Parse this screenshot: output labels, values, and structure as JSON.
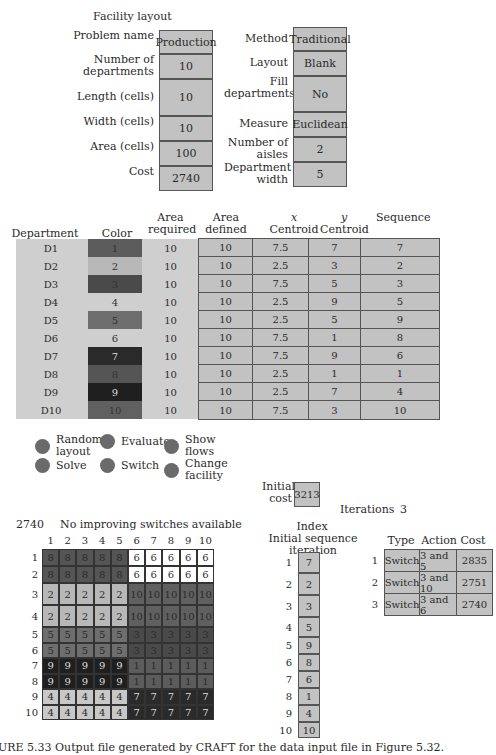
{
  "title": "Facility layout",
  "params_left": [
    {
      "label": "Problem name",
      "value": "Production"
    },
    {
      "label": "Number of departments",
      "value": "10"
    },
    {
      "label": "Length (cells)",
      "value": "10"
    },
    {
      "label": "Width (cells)",
      "value": "10"
    },
    {
      "label": "Area (cells)",
      "value": "100"
    },
    {
      "label": "Cost",
      "value": "2740"
    }
  ],
  "params_right": [
    {
      "label": "Method",
      "value": "Traditional"
    },
    {
      "label": "Layout",
      "value": "Blank"
    },
    {
      "label": "Fill departments",
      "value": "No"
    },
    {
      "label": "Measure",
      "value": "Euclidean"
    },
    {
      "label": "Number of aisles",
      "value": "2"
    },
    {
      "label": "Department width",
      "value": "5"
    }
  ],
  "dept_table": {
    "headers": [
      "Department",
      "Color",
      "Area required",
      "Area defined",
      "x Centroid",
      "y Centroid",
      "Sequence"
    ],
    "rows": [
      {
        "dept": "D1",
        "color": "1",
        "color_hex": "#5c5c5c",
        "req": "10",
        "def": "10",
        "x": "7.5",
        "y": "7",
        "seq": "7"
      },
      {
        "dept": "D2",
        "color": "2",
        "color_hex": "#b8b8b8",
        "req": "10",
        "def": "10",
        "x": "2.5",
        "y": "3",
        "seq": "2"
      },
      {
        "dept": "D3",
        "color": "3",
        "color_hex": "#4a4a4a",
        "req": "10",
        "def": "10",
        "x": "7.5",
        "y": "5",
        "seq": "3"
      },
      {
        "dept": "D4",
        "color": "4",
        "color_hex": "#cfcfcf",
        "req": "10",
        "def": "10",
        "x": "2.5",
        "y": "9",
        "seq": "5"
      },
      {
        "dept": "D5",
        "color": "5",
        "color_hex": "#6e6e6e",
        "req": "10",
        "def": "10",
        "x": "2.5",
        "y": "5",
        "seq": "9"
      },
      {
        "dept": "D6",
        "color": "6",
        "color_hex": "#cfcfcf",
        "req": "10",
        "def": "10",
        "x": "7.5",
        "y": "1",
        "seq": "8"
      },
      {
        "dept": "D7",
        "color": "7",
        "color_hex": "#2a2a2a",
        "req": "10",
        "def": "10",
        "x": "7.5",
        "y": "9",
        "seq": "6"
      },
      {
        "dept": "D8",
        "color": "8",
        "color_hex": "#555555",
        "req": "10",
        "def": "10",
        "x": "2.5",
        "y": "1",
        "seq": "1"
      },
      {
        "dept": "D9",
        "color": "9",
        "color_hex": "#1f1f1f",
        "req": "10",
        "def": "10",
        "x": "2.5",
        "y": "7",
        "seq": "4"
      },
      {
        "dept": "D10",
        "color": "10",
        "color_hex": "#606060",
        "req": "10",
        "def": "10",
        "x": "7.5",
        "y": "3",
        "seq": "10"
      }
    ]
  },
  "buttons": [
    {
      "label": "Random layout"
    },
    {
      "label": "Evaluate"
    },
    {
      "label": "Show flows"
    },
    {
      "label": "Solve"
    },
    {
      "label": "Switch"
    },
    {
      "label": "Change facility"
    }
  ],
  "initial_cost": {
    "label": "Initial cost",
    "value": "3213"
  },
  "iterations": {
    "label": "Iterations",
    "value": "3"
  },
  "status": {
    "cost": "2740",
    "message": "No improving switches available"
  },
  "grid": {
    "col_labels": [
      "1",
      "2",
      "3",
      "4",
      "5",
      "6",
      "7",
      "8",
      "9",
      "10"
    ],
    "row_labels": [
      "1",
      "2",
      "3",
      "4",
      "5",
      "6",
      "7",
      "8",
      "9",
      "10"
    ],
    "rows": [
      [
        "8",
        "8",
        "8",
        "8",
        "8",
        "6",
        "6",
        "6",
        "6",
        "6"
      ],
      [
        "8",
        "8",
        "8",
        "8",
        "8",
        "6",
        "6",
        "6",
        "6",
        "6"
      ],
      [
        "2",
        "2",
        "2",
        "2",
        "2",
        "10",
        "10",
        "10",
        "10",
        "10"
      ],
      [
        "2",
        "2",
        "2",
        "2",
        "2",
        "10",
        "10",
        "10",
        "10",
        "10"
      ],
      [
        "5",
        "5",
        "5",
        "5",
        "5",
        "3",
        "3",
        "3",
        "3",
        "3"
      ],
      [
        "5",
        "5",
        "5",
        "5",
        "5",
        "3",
        "3",
        "3",
        "3",
        "3"
      ],
      [
        "9",
        "9",
        "9",
        "9",
        "9",
        "1",
        "1",
        "1",
        "1",
        "1"
      ],
      [
        "9",
        "9",
        "9",
        "9",
        "9",
        "1",
        "1",
        "1",
        "1",
        "1"
      ],
      [
        "4",
        "4",
        "4",
        "4",
        "4",
        "7",
        "7",
        "7",
        "7",
        "7"
      ],
      [
        "4",
        "4",
        "4",
        "4",
        "4",
        "7",
        "7",
        "7",
        "7",
        "7"
      ]
    ],
    "dept_colors": {
      "1": "#5c5c5c",
      "2": "#b8b8b8",
      "3": "#4a4a4a",
      "4": "#c8c8c8",
      "5": "#6e6e6e",
      "6": "#ffffff",
      "7": "#2a2a2a",
      "8": "#555555",
      "9": "#1f1f1f",
      "10": "#606060"
    }
  },
  "sequence": {
    "header_line1": "Index",
    "header_line2": "Initial sequence iteration",
    "items": [
      {
        "index": "1",
        "value": "7"
      },
      {
        "index": "2",
        "value": "2"
      },
      {
        "index": "3",
        "value": "3"
      },
      {
        "index": "4",
        "value": "5"
      },
      {
        "index": "5",
        "value": "9"
      },
      {
        "index": "6",
        "value": "8"
      },
      {
        "index": "7",
        "value": "6"
      },
      {
        "index": "8",
        "value": "1"
      },
      {
        "index": "9",
        "value": "4"
      },
      {
        "index": "10",
        "value": "10"
      }
    ]
  },
  "iter_table": {
    "headers": [
      "Type",
      "Action",
      "Cost"
    ],
    "rows": [
      {
        "n": "1",
        "type": "Switch",
        "action": "3 and 5",
        "cost": "2835"
      },
      {
        "n": "2",
        "type": "Switch",
        "action": "3 and 10",
        "cost": "2751"
      },
      {
        "n": "3",
        "type": "Switch",
        "action": "3 and 6",
        "cost": "2740"
      }
    ]
  },
  "caption": "URE 5.33   Output file generated by CRAFT for the data input file in Figure 5.32."
}
